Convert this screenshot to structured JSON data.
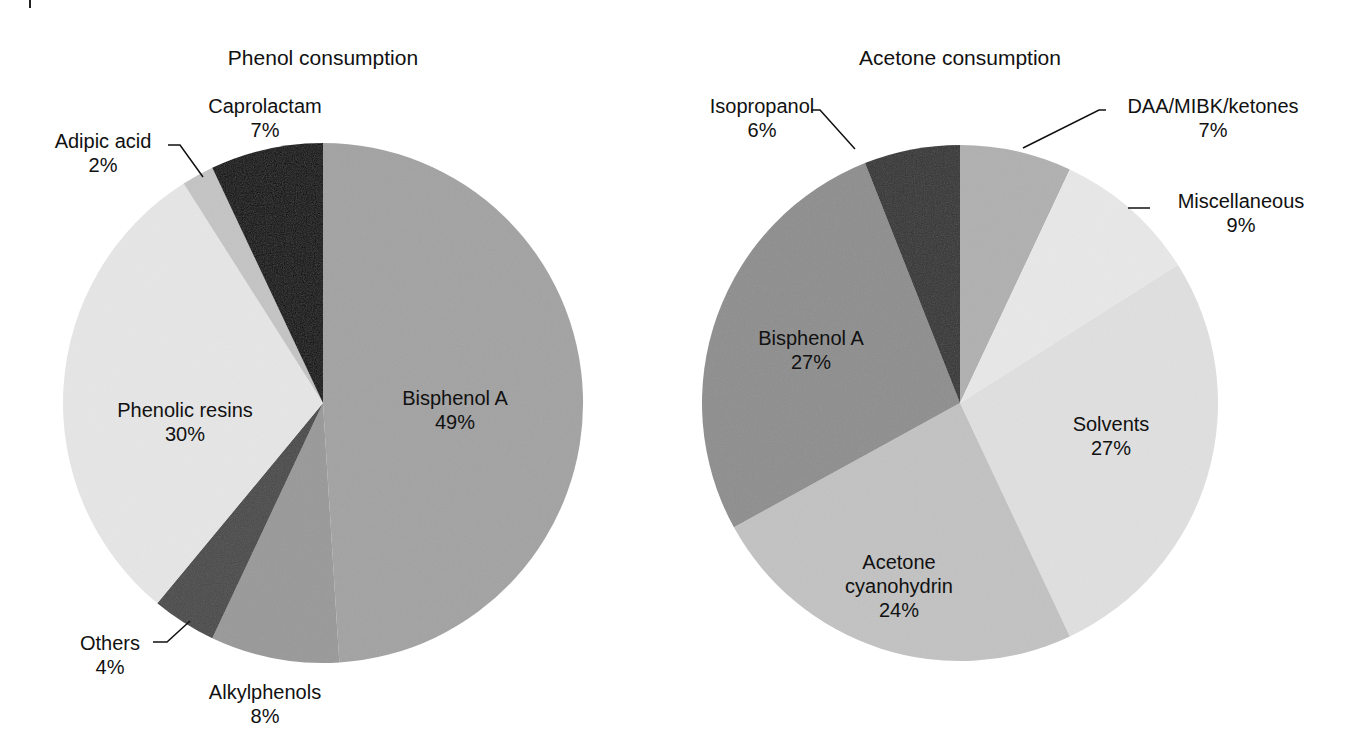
{
  "chart_data": [
    {
      "type": "pie",
      "title": "Phenol consumption",
      "categories": [
        "Bisphenol A",
        "Alkylphenols",
        "Others",
        "Phenolic resins",
        "Adipic acid",
        "Caprolactam"
      ],
      "values": [
        49,
        8,
        4,
        30,
        2,
        7
      ],
      "unit": "%",
      "start_angle_deg": 0,
      "direction": "clockwise",
      "colors": [
        "#a3a3a3",
        "#999999",
        "#4a4a4a",
        "#e6e6e6",
        "#c4c4c4",
        "#050505"
      ],
      "labels": [
        {
          "name": "Bisphenol A",
          "pct": "49%",
          "x": 455,
          "y": 410
        },
        {
          "name": "Alkylphenols",
          "pct": "8%",
          "x": 265,
          "y": 704
        },
        {
          "name": "Others",
          "pct": "4%",
          "x": 110,
          "y": 655
        },
        {
          "name": "Phenolic resins",
          "pct": "30%",
          "x": 185,
          "y": 422
        },
        {
          "name": "Adipic acid",
          "pct": "2%",
          "x": 103,
          "y": 153
        },
        {
          "name": "Caprolactam",
          "pct": "7%",
          "x": 265,
          "y": 118
        }
      ],
      "leaders": [
        {
          "for": "Others",
          "points": [
            [
              153,
              642
            ],
            [
              167,
              642
            ],
            [
              190,
              621
            ]
          ]
        },
        {
          "for": "Adipic acid",
          "points": [
            [
              168,
              145
            ],
            [
              180,
              145
            ],
            [
              203,
              177
            ]
          ]
        }
      ],
      "center": [
        323,
        403
      ],
      "radius": 260,
      "title_pos": [
        323,
        58
      ]
    },
    {
      "type": "pie",
      "title": "Acetone consumption",
      "categories": [
        "DAA/MIBK/ketones",
        "Miscellaneous",
        "Solvents",
        "Acetone cyanohydrin",
        "Bisphenol A",
        "Isopropanol"
      ],
      "values": [
        7,
        9,
        27,
        24,
        27,
        6
      ],
      "unit": "%",
      "start_angle_deg": 0,
      "direction": "clockwise",
      "colors": [
        "#b0b0b0",
        "#e8e8e8",
        "#e0e0e0",
        "#c2c2c2",
        "#8e8e8e",
        "#353535"
      ],
      "labels": [
        {
          "name": "DAA/MIBK/ketones",
          "pct": "7%",
          "x": 1213,
          "y": 118
        },
        {
          "name": "Miscellaneous",
          "pct": "9%",
          "x": 1241,
          "y": 213
        },
        {
          "name": "Solvents",
          "pct": "27%",
          "x": 1111,
          "y": 436
        },
        {
          "name": "Acetone cyanohydrin",
          "pct": "24%",
          "x": 899,
          "y": 586
        },
        {
          "name": "Bisphenol A",
          "pct": "27%",
          "x": 811,
          "y": 350
        },
        {
          "name": "Isopropanol",
          "pct": "6%",
          "x": 762,
          "y": 118
        }
      ],
      "leaders": [
        {
          "for": "Isopropanol",
          "points": [
            [
              811,
              110
            ],
            [
              820,
              110
            ],
            [
              855,
              149
            ]
          ]
        },
        {
          "for": "DAA/MIBK/ketones",
          "points": [
            [
              1106,
              110
            ],
            [
              1099,
              110
            ],
            [
              1023,
              148
            ]
          ]
        },
        {
          "for": "Miscellaneous",
          "points": [
            [
              1128,
              208
            ],
            [
              1150,
              208
            ]
          ]
        }
      ],
      "center": [
        960,
        403
      ],
      "radius": 258,
      "title_pos": [
        960,
        58
      ]
    }
  ]
}
